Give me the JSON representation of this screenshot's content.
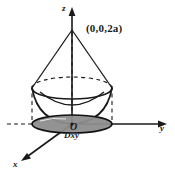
{
  "figure": {
    "axes": {
      "z_label": "z",
      "y_label": "y",
      "x_label": "x",
      "origin_label": "O"
    },
    "labels": {
      "apex_point": "(0,0,2a)",
      "region": "Dxy"
    },
    "colors": {
      "stroke": "#1a1a1a",
      "region_fill": "#8d8d8d",
      "region_stroke": "#111111",
      "background": "#ffffff"
    },
    "geometry": {
      "apex": [
        72,
        30
      ],
      "origin": [
        72,
        124
      ],
      "ellipse_center": [
        72,
        88
      ],
      "ellipse_rx": 40,
      "ellipse_ry": 11,
      "disk_center": [
        72,
        124
      ],
      "disk_rx": 40,
      "disk_ry": 9
    }
  }
}
